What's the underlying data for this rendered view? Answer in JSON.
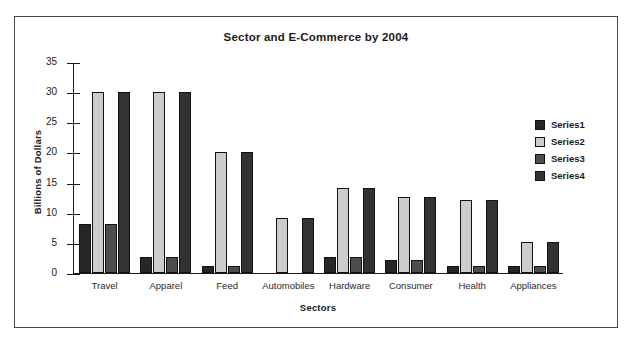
{
  "chart_data": {
    "type": "bar",
    "title": "Sector and E-Commerce by 2004",
    "xlabel": "Sectors",
    "ylabel": "Billions of Dollars",
    "ylim": [
      0,
      35
    ],
    "yticks": [
      0,
      5,
      10,
      15,
      20,
      25,
      30,
      35
    ],
    "grid": false,
    "legend_position": "right",
    "categories": [
      "Travel",
      "Apparel",
      "Feed",
      "Automobiles",
      "Hardware",
      "Consumer",
      "Health",
      "Appliances"
    ],
    "series": [
      {
        "name": "Series1",
        "color": "#262626",
        "values": [
          8,
          2.5,
          1,
          0,
          2.5,
          2,
          1,
          1
        ]
      },
      {
        "name": "Series2",
        "color": "#cccccc",
        "values": [
          30,
          30,
          20,
          9,
          14,
          12.5,
          12,
          5
        ]
      },
      {
        "name": "Series3",
        "color": "#4d4d4d",
        "values": [
          8,
          2.5,
          1,
          0,
          2.5,
          2,
          1,
          1
        ]
      },
      {
        "name": "Series4",
        "color": "#333333",
        "values": [
          30,
          30,
          20,
          9,
          14,
          12.5,
          12,
          5
        ]
      }
    ]
  }
}
